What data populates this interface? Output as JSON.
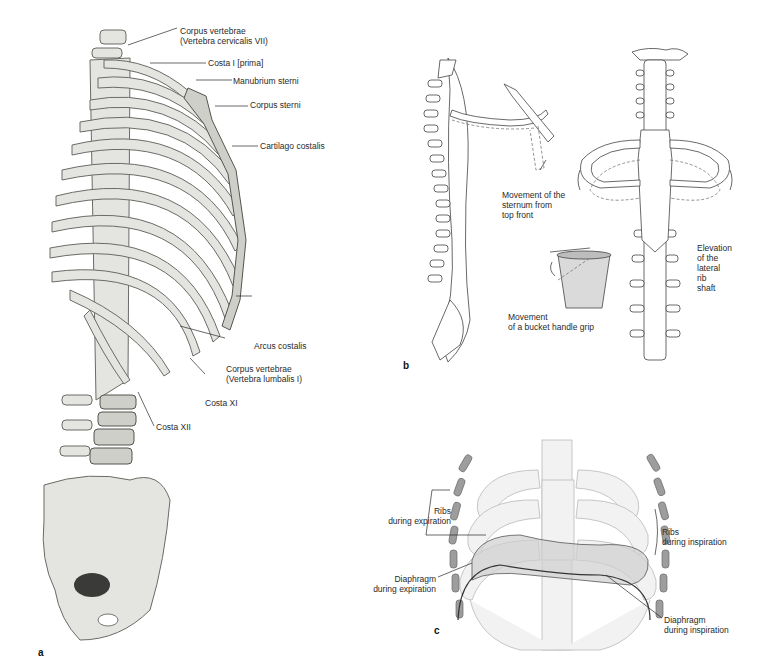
{
  "figure": {
    "panels": [
      {
        "letter": "a",
        "description": "Rib cage and spine, anterolateral view",
        "labels": [
          {
            "id": "cv7_line1",
            "text": "Corpus vertebrae"
          },
          {
            "id": "cv7_line2",
            "text": "(Vertebra cervicalis VII)"
          },
          {
            "id": "costa1",
            "text": "Costa I [prima]"
          },
          {
            "id": "manubrium",
            "text": "Manubrium sterni"
          },
          {
            "id": "corpus_sterni",
            "text": "Corpus sterni"
          },
          {
            "id": "cartilago",
            "text": "Cartilago costalis"
          },
          {
            "id": "arcus",
            "text": "Arcus costalis"
          },
          {
            "id": "lv1_line1",
            "text": "Corpus vertebrae"
          },
          {
            "id": "lv1_line2",
            "text": "(Vertebra lumbalis I)"
          },
          {
            "id": "costa11",
            "text": "Costa XI"
          },
          {
            "id": "costa12",
            "text": "Costa XII"
          }
        ]
      },
      {
        "letter": "b",
        "description": "Rib movement mechanics",
        "labels": [
          {
            "id": "sternum_move",
            "text": "Movement of the\nsternum from\ntop front"
          },
          {
            "id": "bucket",
            "text": "Movement\nof a bucket handle grip"
          },
          {
            "id": "elevation",
            "text": "Elevation\nof the\nlateral\nrib\nshaft"
          }
        ]
      },
      {
        "letter": "c",
        "description": "Ribs and diaphragm during breathing",
        "labels": [
          {
            "id": "ribs_exp",
            "text": "Ribs\nduring expiration"
          },
          {
            "id": "ribs_insp",
            "text": "Ribs\nduring inspiration"
          },
          {
            "id": "diaph_exp",
            "text": "Diaphragm\nduring expiration"
          },
          {
            "id": "diaph_insp",
            "text": "Diaphragm\nduring inspiration"
          }
        ]
      }
    ]
  }
}
